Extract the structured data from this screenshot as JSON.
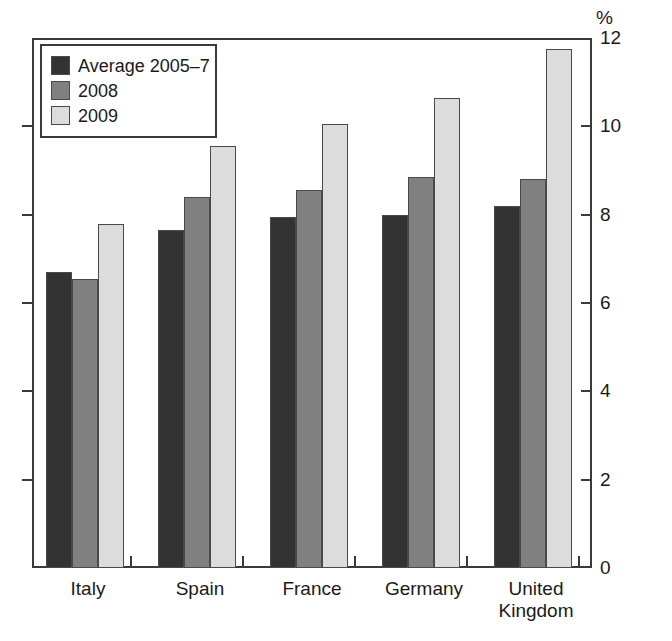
{
  "chart_data": {
    "type": "bar",
    "title": "",
    "subtitle": "",
    "xlabel": "",
    "ylabel": "",
    "unit_label": "%",
    "categories": [
      "Italy",
      "Spain",
      "France",
      "Germany",
      "United Kingdom"
    ],
    "category_display": [
      "Italy",
      "Spain",
      "France",
      "Germany",
      "United\nKingdom"
    ],
    "series": [
      {
        "name": "Average 2005–7",
        "color": "#333333",
        "values": [
          6.7,
          7.65,
          7.95,
          8.0,
          8.2
        ]
      },
      {
        "name": "2008",
        "color": "#808080",
        "values": [
          6.55,
          8.4,
          8.55,
          8.85,
          8.8
        ]
      },
      {
        "name": "2009",
        "color": "#dcdcdc",
        "values": [
          7.8,
          9.55,
          10.05,
          10.65,
          11.75
        ]
      }
    ],
    "ylim": [
      0,
      12
    ],
    "yticks": [
      0,
      2,
      4,
      6,
      8,
      10,
      12
    ],
    "ytick_labels": [
      "0",
      "2",
      "4",
      "6",
      "8",
      "10",
      "12"
    ],
    "grid": false,
    "legend_position": "top-left",
    "legend_entries": [
      "Average 2005–7",
      "2008",
      "2009"
    ]
  },
  "axis": {
    "unit": "%",
    "tick_0": "0",
    "tick_2": "2",
    "tick_4": "4",
    "tick_6": "6",
    "tick_8": "8",
    "tick_10": "10",
    "tick_12": "12"
  }
}
